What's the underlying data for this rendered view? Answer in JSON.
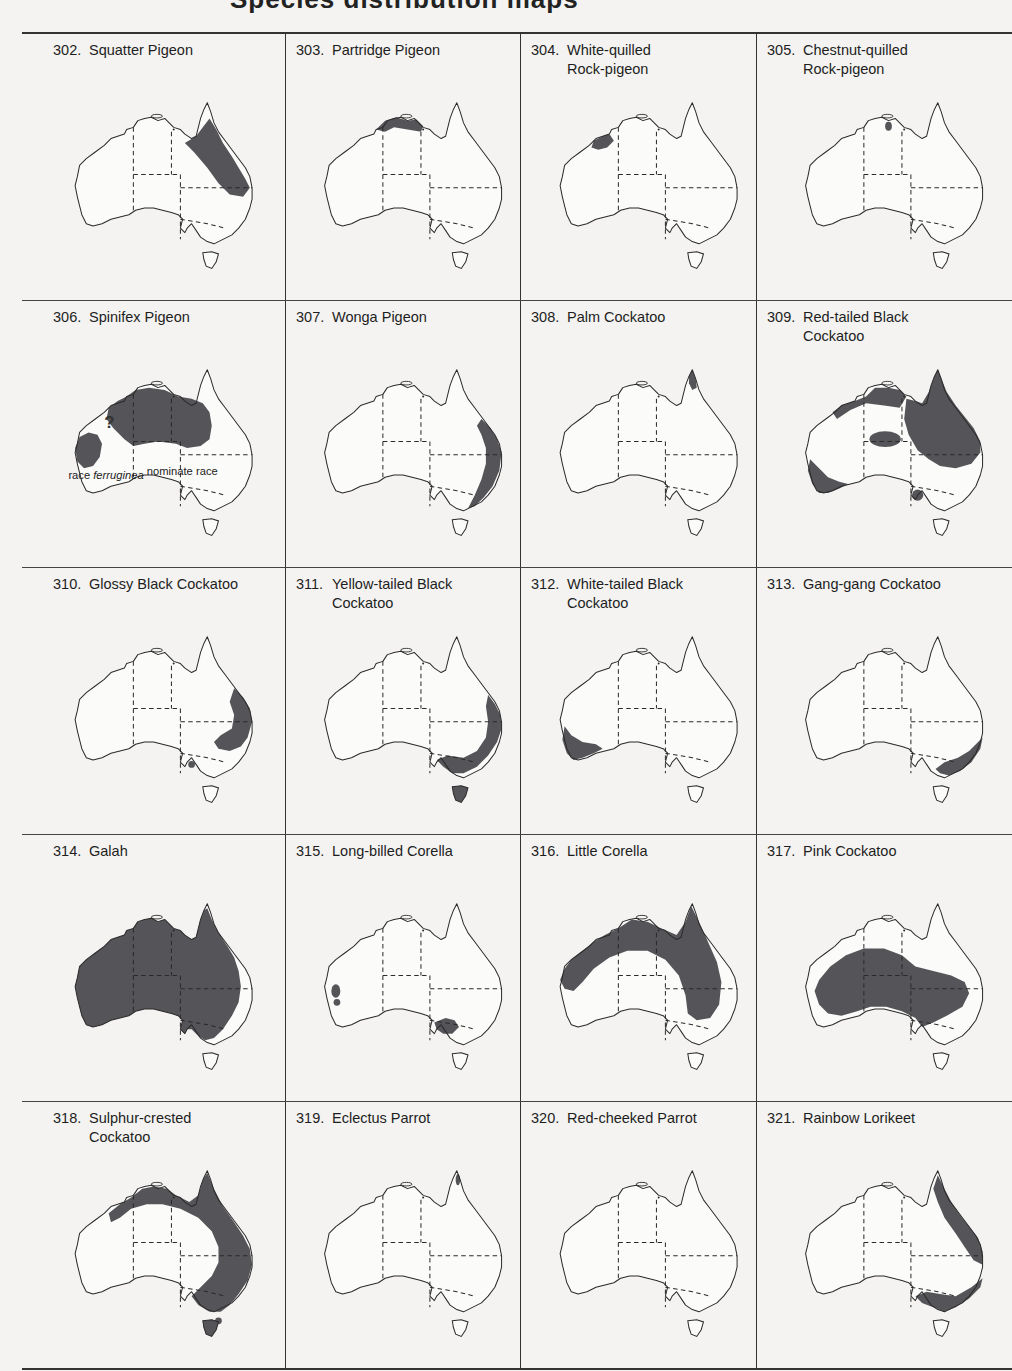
{
  "page": {
    "title_fragment": "Species distribution maps",
    "range_color": "#555458",
    "outline_color": "#2a2a2a",
    "background": "#f4f3f1"
  },
  "rows": [
    {
      "cells": [
        {
          "number": "302.",
          "name": "Squatter Pigeon",
          "range": "squatter"
        },
        {
          "number": "303.",
          "name": "Partridge Pigeon",
          "range": "partridge"
        },
        {
          "number": "304.",
          "name": "White-quilled\nRock-pigeon",
          "range": "whitequilled"
        },
        {
          "number": "305.",
          "name": "Chestnut-quilled\nRock-pigeon",
          "range": "chestnutquilled"
        }
      ]
    },
    {
      "cells": [
        {
          "number": "306.",
          "name": "Spinifex Pigeon",
          "range": "spinifex",
          "annotations": {
            "question": "?",
            "race_west_prefix": "race ",
            "race_west_name": "ferruginea",
            "race_main": "nominate race"
          }
        },
        {
          "number": "307.",
          "name": "Wonga Pigeon",
          "range": "wonga"
        },
        {
          "number": "308.",
          "name": "Palm Cockatoo",
          "range": "palm"
        },
        {
          "number": "309.",
          "name": "Red-tailed Black\nCockatoo",
          "range": "redtailed"
        }
      ]
    },
    {
      "cells": [
        {
          "number": "310.",
          "name": "Glossy Black Cockatoo",
          "range": "glossy"
        },
        {
          "number": "311.",
          "name": "Yellow-tailed Black\nCockatoo",
          "range": "yellowtailed"
        },
        {
          "number": "312.",
          "name": "White-tailed Black\nCockatoo",
          "range": "whitetailed"
        },
        {
          "number": "313.",
          "name": "Gang-gang Cockatoo",
          "range": "ganggang"
        }
      ]
    },
    {
      "cells": [
        {
          "number": "314.",
          "name": "Galah",
          "range": "galah"
        },
        {
          "number": "315.",
          "name": "Long-billed Corella",
          "range": "longbilled"
        },
        {
          "number": "316.",
          "name": "Little Corella",
          "range": "littlecorella"
        },
        {
          "number": "317.",
          "name": "Pink Cockatoo",
          "range": "pink"
        }
      ]
    },
    {
      "cells": [
        {
          "number": "318.",
          "name": "Sulphur-crested\nCockatoo",
          "range": "sulphur"
        },
        {
          "number": "319.",
          "name": "Eclectus Parrot",
          "range": "eclectus"
        },
        {
          "number": "320.",
          "name": "Red-cheeked Parrot",
          "range": "redcheeked"
        },
        {
          "number": "321.",
          "name": "Rainbow Lorikeet",
          "range": "rainbow"
        }
      ]
    }
  ]
}
